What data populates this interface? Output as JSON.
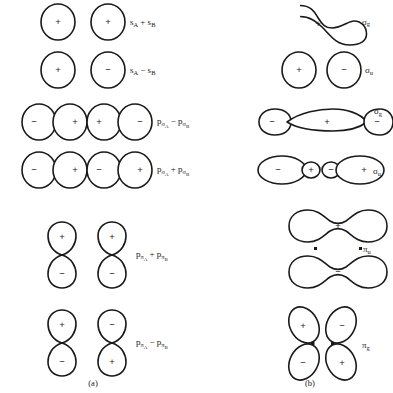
{
  "figure": {
    "background_color": "#ffffff",
    "stroke_color": "#1a1a1a",
    "captions": [
      {
        "id": "caption-a",
        "text": "(a)",
        "x": 93,
        "y": 384
      },
      {
        "id": "caption-b",
        "text": "(b)",
        "x": 310,
        "y": 384
      }
    ],
    "columns": [
      {
        "id": "column-a",
        "caption": "(a)",
        "description": "atomic orbital combinations"
      },
      {
        "id": "column-b",
        "caption": "(b)",
        "description": "resulting molecular orbitals"
      }
    ],
    "rows": [
      {
        "id": "row-1",
        "left": {
          "id": "combination-s-plus-s",
          "shape": "two-separate-circles",
          "signs": [
            "+",
            "+"
          ],
          "label": {
            "base": "s",
            "sub": "A",
            "op": "+",
            "base2": "s",
            "sub2": "B",
            "plain": "sA + sB"
          }
        },
        "right": {
          "id": "mo-sigma-g-bonding-s",
          "shape": "peanut",
          "signs": [
            "+"
          ],
          "label": {
            "base": "σ",
            "sub": "g",
            "plain": "σg"
          }
        }
      },
      {
        "id": "row-2",
        "left": {
          "id": "combination-s-minus-s",
          "shape": "two-separate-circles",
          "signs": [
            "+",
            "−"
          ],
          "label": {
            "base": "s",
            "sub": "A",
            "op": "−",
            "base2": "s",
            "sub2": "B",
            "plain": "sA − sB"
          }
        },
        "right": {
          "id": "mo-sigma-u-antibonding-s",
          "shape": "two-separate-circles",
          "signs": [
            "+",
            "−"
          ],
          "label": {
            "base": "σ",
            "sub": "u",
            "plain": "σu"
          }
        }
      },
      {
        "id": "row-3",
        "left": {
          "id": "combination-psigma-minus-psigma",
          "shape": "two-horizontal-p-orbitals",
          "signs": [
            "−",
            "+",
            "+",
            "−"
          ],
          "label": {
            "base": "p",
            "sub": "σ",
            "subsub": "A",
            "op": "−",
            "base2": "p",
            "sub2": "σ",
            "subsub2": "B",
            "plain": "pσA − pσB"
          }
        },
        "right": {
          "id": "mo-sigma-g-bonding-p",
          "shape": "three-lobe-inline",
          "signs": [
            "−",
            "+",
            "−"
          ],
          "label": {
            "base": "σ",
            "sub": "g",
            "plain": "σg"
          }
        }
      },
      {
        "id": "row-4",
        "left": {
          "id": "combination-psigma-plus-psigma",
          "shape": "two-horizontal-p-orbitals",
          "signs": [
            "−",
            "+",
            "−",
            "+"
          ],
          "label": {
            "base": "p",
            "sub": "σ",
            "subsub": "A",
            "op": "+",
            "base2": "p",
            "sub2": "σ",
            "subsub2": "B",
            "plain": "pσA + pσB"
          }
        },
        "right": {
          "id": "mo-sigma-u-antibonding-p",
          "shape": "four-lobe-inline",
          "signs": [
            "−",
            "+",
            "−",
            "+"
          ],
          "label": {
            "base": "σ",
            "sub": "u",
            "plain": "σu"
          }
        }
      },
      {
        "id": "row-5",
        "left": {
          "id": "combination-ppi-plus-ppi",
          "shape": "two-vertical-p-orbitals",
          "signs": [
            "+",
            "−",
            "+",
            "−"
          ],
          "label": {
            "base": "p",
            "sub": "π",
            "subsub": "A",
            "op": "+",
            "base2": "p",
            "sub2": "π",
            "subsub2": "B",
            "plain": "pπA + pπB"
          }
        },
        "right": {
          "id": "mo-pi-u-bonding",
          "shape": "two-stacked-peanuts",
          "signs": [
            "+",
            "−"
          ],
          "label": {
            "base": "π",
            "sub": "u",
            "plain": "πu"
          }
        }
      },
      {
        "id": "row-6",
        "left": {
          "id": "combination-ppi-minus-ppi",
          "shape": "two-vertical-p-orbitals",
          "signs": [
            "+",
            "−",
            "−",
            "+"
          ],
          "label": {
            "base": "p",
            "sub": "π",
            "subsub": "A",
            "op": "−",
            "base2": "p",
            "sub2": "π",
            "subsub2": "B",
            "plain": "pπA − pπB"
          }
        },
        "right": {
          "id": "mo-pi-g-antibonding",
          "shape": "four-lobe-cloverleaf",
          "signs": [
            "+",
            "−",
            "−",
            "+"
          ],
          "label": {
            "base": "π",
            "sub": "g",
            "plain": "πg"
          }
        }
      }
    ]
  }
}
